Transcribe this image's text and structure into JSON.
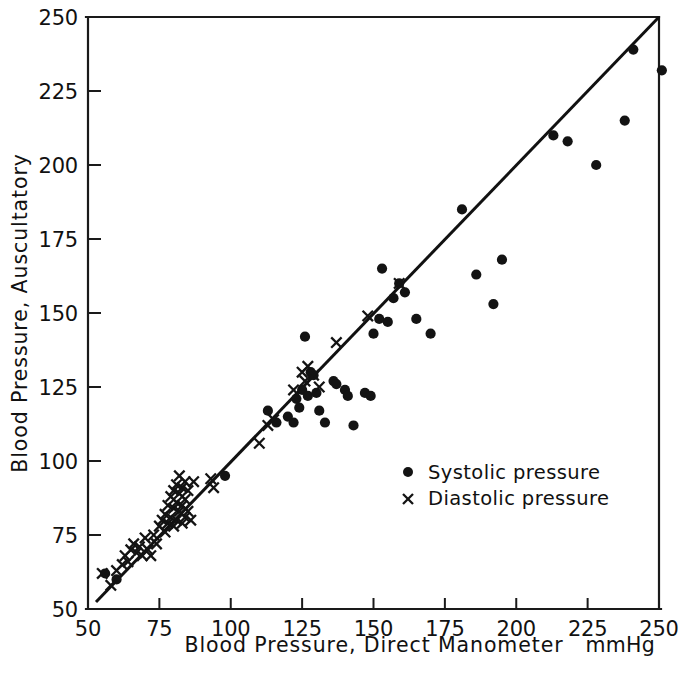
{
  "figure": {
    "title": "",
    "unit_label": "mmHg"
  },
  "chart_data": {
    "type": "scatter",
    "title": "",
    "xlabel": "Blood Pressure, Direct Manometer",
    "ylabel": "Blood Pressure, Auscultatory",
    "unit": "mmHg",
    "xlim": [
      50,
      250
    ],
    "ylim": [
      50,
      250
    ],
    "xticks": [
      50,
      75,
      100,
      125,
      150,
      175,
      200,
      225,
      250
    ],
    "yticks": [
      50,
      75,
      100,
      125,
      150,
      175,
      200,
      225,
      250
    ],
    "xtick_labels": [
      "50",
      "75",
      "100",
      "125",
      "150",
      "175",
      "200",
      "225",
      "250"
    ],
    "ytick_labels": [
      "50",
      "75",
      "100",
      "125",
      "150",
      "175",
      "200",
      "225",
      "250"
    ],
    "grid": false,
    "legend_position": "center-right",
    "reference_line": {
      "label": "line of identity",
      "style": "solid",
      "from": [
        53,
        52
      ],
      "to": [
        250,
        250
      ]
    },
    "series": [
      {
        "name": "Systolic pressure",
        "marker": "circle",
        "color": "#131313",
        "points": [
          [
            56,
            62
          ],
          [
            60,
            60
          ],
          [
            98,
            95
          ],
          [
            113,
            117
          ],
          [
            116,
            113
          ],
          [
            120,
            115
          ],
          [
            122,
            113
          ],
          [
            123,
            121
          ],
          [
            124,
            118
          ],
          [
            125,
            124
          ],
          [
            126,
            142
          ],
          [
            127,
            122
          ],
          [
            128,
            130
          ],
          [
            129,
            129
          ],
          [
            130,
            123
          ],
          [
            131,
            117
          ],
          [
            133,
            113
          ],
          [
            136,
            127
          ],
          [
            137,
            126
          ],
          [
            140,
            124
          ],
          [
            141,
            122
          ],
          [
            143,
            112
          ],
          [
            147,
            123
          ],
          [
            149,
            122
          ],
          [
            150,
            143
          ],
          [
            152,
            148
          ],
          [
            153,
            165
          ],
          [
            155,
            147
          ],
          [
            157,
            155
          ],
          [
            159,
            160
          ],
          [
            161,
            157
          ],
          [
            165,
            148
          ],
          [
            170,
            143
          ],
          [
            181,
            185
          ],
          [
            186,
            163
          ],
          [
            192,
            153
          ],
          [
            195,
            168
          ],
          [
            213,
            210
          ],
          [
            218,
            208
          ],
          [
            228,
            200
          ],
          [
            238,
            215
          ],
          [
            241,
            239
          ],
          [
            251,
            232
          ]
        ]
      },
      {
        "name": "Diastolic pressure",
        "marker": "cross",
        "color": "#131313",
        "points": [
          [
            55,
            62
          ],
          [
            58,
            58
          ],
          [
            60,
            63
          ],
          [
            62,
            65
          ],
          [
            63,
            68
          ],
          [
            64,
            66
          ],
          [
            65,
            70
          ],
          [
            66,
            72
          ],
          [
            67,
            69
          ],
          [
            68,
            71
          ],
          [
            69,
            68
          ],
          [
            70,
            74
          ],
          [
            71,
            70
          ],
          [
            72,
            68
          ],
          [
            73,
            75
          ],
          [
            74,
            72
          ],
          [
            75,
            78
          ],
          [
            76,
            80
          ],
          [
            77,
            82
          ],
          [
            77,
            76
          ],
          [
            78,
            85
          ],
          [
            78,
            79
          ],
          [
            79,
            81
          ],
          [
            79,
            88
          ],
          [
            80,
            84
          ],
          [
            80,
            90
          ],
          [
            80,
            78
          ],
          [
            81,
            92
          ],
          [
            81,
            86
          ],
          [
            81,
            80
          ],
          [
            82,
            95
          ],
          [
            82,
            89
          ],
          [
            82,
            83
          ],
          [
            83,
            91
          ],
          [
            83,
            85
          ],
          [
            83,
            79
          ],
          [
            84,
            93
          ],
          [
            84,
            87
          ],
          [
            84,
            81
          ],
          [
            85,
            90
          ],
          [
            85,
            83
          ],
          [
            86,
            80
          ],
          [
            87,
            93
          ],
          [
            93,
            94
          ],
          [
            94,
            91
          ],
          [
            110,
            106
          ],
          [
            113,
            112
          ],
          [
            115,
            114
          ],
          [
            122,
            124
          ],
          [
            125,
            130
          ],
          [
            126,
            127
          ],
          [
            127,
            132
          ],
          [
            129,
            129
          ],
          [
            131,
            125
          ],
          [
            137,
            140
          ],
          [
            148,
            149
          ],
          [
            159,
            160
          ]
        ]
      }
    ]
  },
  "legend": {
    "items": [
      {
        "marker": "circle",
        "label": "Systolic pressure"
      },
      {
        "marker": "cross",
        "label": "Diastolic pressure"
      }
    ]
  },
  "axes": {
    "x_title": "Blood Pressure, Direct Manometer",
    "y_title": "Blood Pressure, Auscultatory"
  }
}
